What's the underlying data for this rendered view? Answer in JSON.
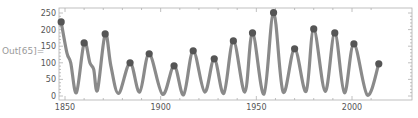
{
  "cell": {
    "out_label": "Out[65]="
  },
  "colors": {
    "line": "#8a8a8a",
    "marker": "#555555",
    "frame": "#b0b0b0",
    "tick_text": "#555555"
  },
  "chart_data": {
    "type": "line",
    "title": "",
    "xlabel": "",
    "ylabel": "",
    "xlim": [
      1845,
      2020
    ],
    "ylim": [
      0,
      260
    ],
    "x_ticks": [
      1850,
      1900,
      1950,
      2000
    ],
    "y_ticks": [
      0,
      50,
      100,
      150,
      200,
      250
    ],
    "grid": false,
    "legend": null,
    "series": [
      {
        "name": "smoothed series",
        "style": "thick gray line",
        "points": [
          [
            1848,
            223
          ],
          [
            1851,
            130
          ],
          [
            1853,
            100
          ],
          [
            1856,
            10
          ],
          [
            1860,
            160
          ],
          [
            1863,
            100
          ],
          [
            1865,
            80
          ],
          [
            1867,
            18
          ],
          [
            1871,
            187
          ],
          [
            1874,
            90
          ],
          [
            1878,
            8
          ],
          [
            1884,
            100
          ],
          [
            1889,
            12
          ],
          [
            1894,
            127
          ],
          [
            1901,
            5
          ],
          [
            1907,
            91
          ],
          [
            1912,
            4
          ],
          [
            1917,
            136
          ],
          [
            1923,
            12
          ],
          [
            1928,
            112
          ],
          [
            1933,
            8
          ],
          [
            1938,
            166
          ],
          [
            1944,
            12
          ],
          [
            1948,
            190
          ],
          [
            1954,
            6
          ],
          [
            1959,
            251
          ],
          [
            1964,
            12
          ],
          [
            1970,
            142
          ],
          [
            1976,
            14
          ],
          [
            1980,
            202
          ],
          [
            1986,
            14
          ],
          [
            1991,
            190
          ],
          [
            1996,
            10
          ],
          [
            2001,
            157
          ],
          [
            2008,
            3
          ],
          [
            2014,
            97
          ]
        ]
      },
      {
        "name": "cycle maxima",
        "style": "dark gray dots",
        "points": [
          [
            1848,
            223
          ],
          [
            1860,
            160
          ],
          [
            1871,
            187
          ],
          [
            1884,
            100
          ],
          [
            1894,
            127
          ],
          [
            1907,
            91
          ],
          [
            1917,
            136
          ],
          [
            1928,
            112
          ],
          [
            1938,
            166
          ],
          [
            1948,
            190
          ],
          [
            1959,
            251
          ],
          [
            1970,
            142
          ],
          [
            1980,
            202
          ],
          [
            1991,
            190
          ],
          [
            2001,
            157
          ],
          [
            2014,
            97
          ]
        ]
      }
    ]
  }
}
